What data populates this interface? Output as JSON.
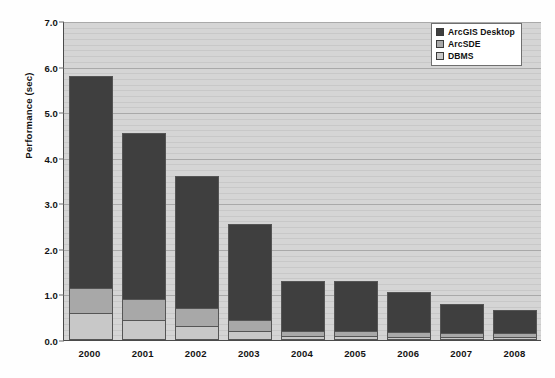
{
  "chart_data": {
    "type": "bar",
    "stacked": true,
    "title": "",
    "xlabel": "",
    "ylabel": "Performance (sec)",
    "ylim": [
      0.0,
      7.0
    ],
    "ytick_step": 1.0,
    "grid": true,
    "minor_grid": true,
    "legend_position": "top-right",
    "categories": [
      "2000",
      "2001",
      "2002",
      "2003",
      "2004",
      "2005",
      "2006",
      "2007",
      "2008"
    ],
    "ytick_labels": [
      "7.0",
      "6.0",
      "5.0",
      "4.0",
      "3.0",
      "2.0",
      "1.0",
      "0.0"
    ],
    "ytick_values": [
      7.0,
      6.0,
      5.0,
      4.0,
      3.0,
      2.0,
      1.0,
      0.0
    ],
    "series": [
      {
        "name": "ArcGIS Desktop",
        "color": "#3f3f3f",
        "values": [
          4.65,
          3.65,
          2.9,
          2.1,
          1.1,
          1.1,
          0.88,
          0.65,
          0.5
        ]
      },
      {
        "name": "ArcSDE",
        "color": "#a8a8a8",
        "values": [
          0.55,
          0.45,
          0.4,
          0.25,
          0.12,
          0.12,
          0.1,
          0.08,
          0.08
        ]
      },
      {
        "name": "DBMS",
        "color": "#c8c8c8",
        "values": [
          0.6,
          0.45,
          0.3,
          0.2,
          0.08,
          0.08,
          0.07,
          0.07,
          0.07
        ]
      }
    ],
    "totals": [
      5.8,
      4.55,
      3.6,
      2.55,
      1.3,
      1.3,
      1.05,
      0.8,
      0.65
    ],
    "plot_background": "#d5d5d5",
    "axis_color": "#4a4a4a"
  },
  "legend": {
    "items": [
      {
        "label": "ArcGIS Desktop"
      },
      {
        "label": "ArcSDE"
      },
      {
        "label": "DBMS"
      }
    ]
  }
}
